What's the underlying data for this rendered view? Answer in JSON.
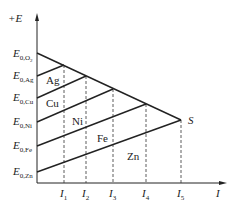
{
  "axes": {
    "y_label": "+E",
    "x_label": "I"
  },
  "y_ticks": [
    {
      "main": "E",
      "sub": "0,O",
      "sub2": "2"
    },
    {
      "main": "E",
      "sub": "0,Ag",
      "sub2": ""
    },
    {
      "main": "E",
      "sub": "0,Cu",
      "sub2": ""
    },
    {
      "main": "E",
      "sub": "0,Ni",
      "sub2": ""
    },
    {
      "main": "E",
      "sub": "0,Fe",
      "sub2": ""
    },
    {
      "main": "E",
      "sub": "0,Zn",
      "sub2": ""
    }
  ],
  "x_ticks": [
    {
      "main": "I",
      "sub": "1"
    },
    {
      "main": "I",
      "sub": "2"
    },
    {
      "main": "I",
      "sub": "3"
    },
    {
      "main": "I",
      "sub": "4"
    },
    {
      "main": "I",
      "sub": "5"
    }
  ],
  "regions": [
    "Ag",
    "Cu",
    "Ni",
    "Fe",
    "Zn"
  ],
  "point_label": "S"
}
